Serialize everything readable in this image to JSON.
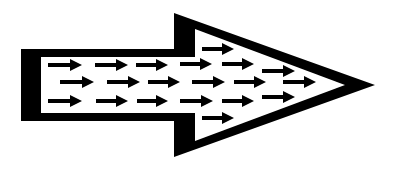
{
  "diagram": {
    "colors": {
      "background": "#ffffff",
      "ink": "#000000"
    },
    "big_arrow": {
      "outer": [
        [
          21,
          49
        ],
        [
          174,
          49
        ],
        [
          174,
          13
        ],
        [
          375,
          85
        ],
        [
          174,
          157
        ],
        [
          174,
          121
        ],
        [
          21,
          121
        ]
      ],
      "inner_shaft": [
        [
          41,
          57
        ],
        [
          195,
          57
        ],
        [
          195,
          113
        ],
        [
          41,
          113
        ]
      ],
      "inner_head": [
        [
          195,
          29
        ],
        [
          345,
          85
        ],
        [
          195,
          141
        ]
      ]
    },
    "small_arrows": [
      {
        "x1": 48,
        "x2": 82,
        "y": 65
      },
      {
        "x1": 95,
        "x2": 128,
        "y": 65
      },
      {
        "x1": 136,
        "x2": 168,
        "y": 65
      },
      {
        "x1": 180,
        "x2": 212,
        "y": 64
      },
      {
        "x1": 222,
        "x2": 254,
        "y": 64
      },
      {
        "x1": 60,
        "x2": 94,
        "y": 82
      },
      {
        "x1": 107,
        "x2": 140,
        "y": 82
      },
      {
        "x1": 148,
        "x2": 180,
        "y": 82
      },
      {
        "x1": 192,
        "x2": 225,
        "y": 82
      },
      {
        "x1": 234,
        "x2": 266,
        "y": 82
      },
      {
        "x1": 283,
        "x2": 316,
        "y": 82
      },
      {
        "x1": 48,
        "x2": 82,
        "y": 101
      },
      {
        "x1": 96,
        "x2": 128,
        "y": 101
      },
      {
        "x1": 137,
        "x2": 168,
        "y": 101
      },
      {
        "x1": 180,
        "x2": 213,
        "y": 101
      },
      {
        "x1": 222,
        "x2": 254,
        "y": 101
      },
      {
        "x1": 202,
        "x2": 234,
        "y": 49
      },
      {
        "x1": 202,
        "x2": 234,
        "y": 118
      },
      {
        "x1": 262,
        "x2": 295,
        "y": 71
      },
      {
        "x1": 262,
        "x2": 295,
        "y": 97
      }
    ]
  }
}
